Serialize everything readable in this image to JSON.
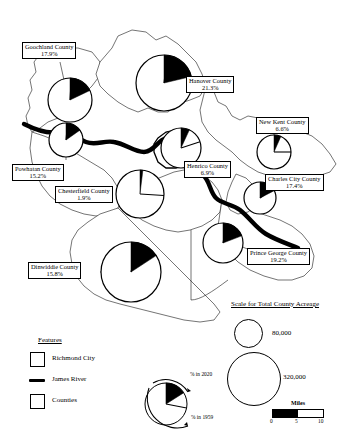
{
  "map": {
    "title": "",
    "counties": [
      {
        "id": "goochland",
        "name": "Goochland County",
        "pct_2020": "17.9%",
        "value": 17.9,
        "label_x": 22,
        "label_y": 42,
        "pie_cx": 70,
        "pie_cy": 100,
        "pie_r": 22,
        "wedge_2020": 17.9,
        "wedge_1959": 1.0
      },
      {
        "id": "hanover",
        "name": "Hanover County",
        "pct_2020": "21.3%",
        "value": 21.3,
        "label_x": 186,
        "label_y": 76,
        "pie_cx": 164,
        "pie_cy": 83,
        "pie_r": 28,
        "wedge_2020": 21.3,
        "wedge_1959": 2.0
      },
      {
        "id": "new-kent",
        "name": "New Kent County",
        "pct_2020": "6.6%",
        "value": 6.6,
        "label_x": 256,
        "label_y": 117,
        "pie_cx": 274,
        "pie_cy": 152,
        "pie_r": 17,
        "wedge_2020": 6.6,
        "wedge_1959": 25.0
      },
      {
        "id": "powhatan",
        "name": "Powhatan County",
        "pct_2020": "15.2%",
        "value": 15.2,
        "label_x": 12,
        "label_y": 164,
        "pie_cx": 66,
        "pie_cy": 140,
        "pie_r": 17,
        "wedge_2020": 15.2,
        "wedge_1959": 1.5
      },
      {
        "id": "henrico",
        "name": "Henrico County",
        "pct_2020": "6.9%",
        "value": 6.9,
        "label_x": 184,
        "label_y": 161,
        "pie_cx": 181,
        "pie_cy": 148,
        "pie_r": 20,
        "wedge_2020": 6.9,
        "wedge_1959": 20.0
      },
      {
        "id": "charles-city",
        "name": "Charles City County",
        "pct_2020": "17.4%",
        "value": 17.4,
        "label_x": 265,
        "label_y": 174,
        "pie_cx": 260,
        "pie_cy": 198,
        "pie_r": 16,
        "wedge_2020": 17.4,
        "wedge_1959": 15.0
      },
      {
        "id": "chesterfield",
        "name": "Chesterfield County",
        "pct_2020": "1.9%",
        "value": 1.9,
        "label_x": 55,
        "label_y": 186,
        "pie_cx": 140,
        "pie_cy": 194,
        "pie_r": 24,
        "wedge_2020": 1.9,
        "wedge_1959": 26.0
      },
      {
        "id": "prince-george",
        "name": "Prince George County",
        "pct_2020": "19.2%",
        "value": 19.2,
        "label_x": 247,
        "label_y": 248,
        "pie_cx": 223,
        "pie_cy": 243,
        "pie_r": 20,
        "wedge_2020": 19.2,
        "wedge_1959": 3.0
      },
      {
        "id": "dinwiddie",
        "name": "Dinwiddie County",
        "pct_2020": "15.8%",
        "value": 15.8,
        "label_x": 28,
        "label_y": 262,
        "pie_cx": 131,
        "pie_cy": 272,
        "pie_r": 30,
        "wedge_2020": 15.8,
        "wedge_1959": 4.0
      }
    ]
  },
  "legend_features": {
    "title": "Features",
    "items": [
      {
        "id": "richmond-city",
        "label": "Richmond City",
        "swatch": "thick-square"
      },
      {
        "id": "james-river",
        "label": "James River",
        "swatch": "thick-line"
      },
      {
        "id": "counties",
        "label": "Counties",
        "swatch": "thin-square"
      }
    ]
  },
  "legend_pie": {
    "label_2020": "% in 2020",
    "label_1959": "% in 1959",
    "wedge_2020": 16.0,
    "wedge_1959": 28.0
  },
  "legend_acreage": {
    "title": "Scale for Total County Acreage",
    "items": [
      {
        "id": "small",
        "label": "80,000",
        "value": 80000,
        "r": 14
      },
      {
        "id": "large",
        "label": "320,000",
        "value": 320000,
        "r": 27
      }
    ]
  },
  "scale_bar": {
    "title": "Miles",
    "ticks": [
      "0",
      "5",
      "10"
    ]
  },
  "chart_data": {
    "type": "pie",
    "categories": [
      "Goochland County",
      "Hanover County",
      "New Kent County",
      "Powhatan County",
      "Henrico County",
      "Charles City County",
      "Chesterfield County",
      "Prince George County",
      "Dinwiddie County"
    ],
    "series": [
      {
        "name": "% in 2020",
        "values": [
          17.9,
          21.3,
          6.6,
          15.2,
          6.9,
          17.4,
          1.9,
          19.2,
          15.8
        ]
      }
    ],
    "sizes": {
      "name": "Total County Acreage",
      "legend_values": [
        80000,
        320000
      ]
    },
    "legend": [
      "% in 2020",
      "% in 1959"
    ],
    "xlabel": "",
    "ylabel": ""
  }
}
